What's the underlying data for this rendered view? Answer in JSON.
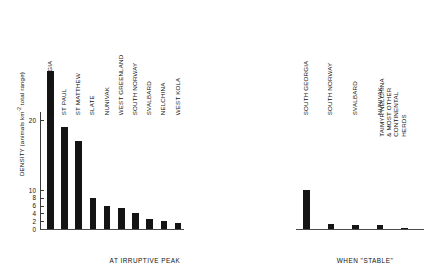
{
  "chart_data": {
    "type": "bar",
    "title": "",
    "xlabel": "",
    "ylabel": "DENSITY (animals km⁻² total range)",
    "ylabel_parts": {
      "pre": "DENSITY (animals km",
      "sup": "-2",
      "post": " total range)"
    },
    "ylim": [
      0,
      28
    ],
    "yticks": [
      0,
      2,
      4,
      6,
      8,
      10,
      20
    ],
    "ytick_labels": [
      "0",
      "2",
      "4",
      "6",
      "8",
      "10",
      "20"
    ],
    "grid": false,
    "legend": "none",
    "axis_note": "broken / compressed scale above 10",
    "groups": [
      {
        "name": "at-irruptive-peak",
        "label": "AT IRRUPTIVE PEAK",
        "categories": [
          "SOUTH GEORGIA",
          "ST PAUL",
          "ST MATTHEW",
          "SLATE",
          "NUNIVAK",
          "WEST GREENLAND",
          "SOUTH NORWAY",
          "SVALBARD",
          "NELCHINA",
          "WEST KOLA"
        ],
        "values": [
          27,
          19,
          17,
          8,
          6,
          5.5,
          4,
          2.5,
          2,
          1.5
        ]
      },
      {
        "name": "when-stable",
        "label": "WHEN \"STABLE\"",
        "categories": [
          "SOUTH GEORGIA",
          "SOUTH NORWAY",
          "SVALBARD",
          "NUNIVAK",
          "TAIMYR NELCHINA\n& MOST OTHER\nCONTINENTAL\nHERDS"
        ],
        "values": [
          10,
          1.3,
          1.0,
          1.0,
          0.2
        ]
      }
    ]
  },
  "colors": {
    "bar": "#141414",
    "axis": "#3a3a3a",
    "text": "#111111",
    "background": "#ffffff"
  }
}
